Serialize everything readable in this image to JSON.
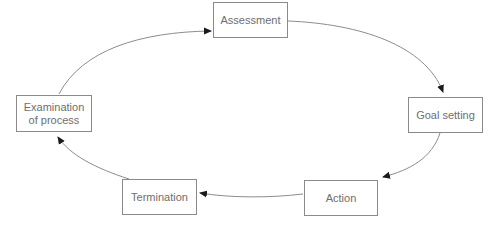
{
  "diagram": {
    "type": "cycle",
    "nodes": [
      {
        "id": "assessment",
        "label": "Assessment"
      },
      {
        "id": "goal_setting",
        "label": "Goal setting"
      },
      {
        "id": "action",
        "label": "Action"
      },
      {
        "id": "termination",
        "label": "Termination"
      },
      {
        "id": "examination",
        "label": "Examination\nof process"
      }
    ],
    "edges": [
      {
        "from": "assessment",
        "to": "goal_setting"
      },
      {
        "from": "goal_setting",
        "to": "action"
      },
      {
        "from": "action",
        "to": "termination"
      },
      {
        "from": "termination",
        "to": "examination"
      },
      {
        "from": "examination",
        "to": "assessment"
      }
    ],
    "colors": {
      "box_border": "#8a8a8a",
      "text": "#6e6e6e",
      "edge": "#8c8c8c",
      "arrowhead": "#1a1a1a"
    }
  }
}
